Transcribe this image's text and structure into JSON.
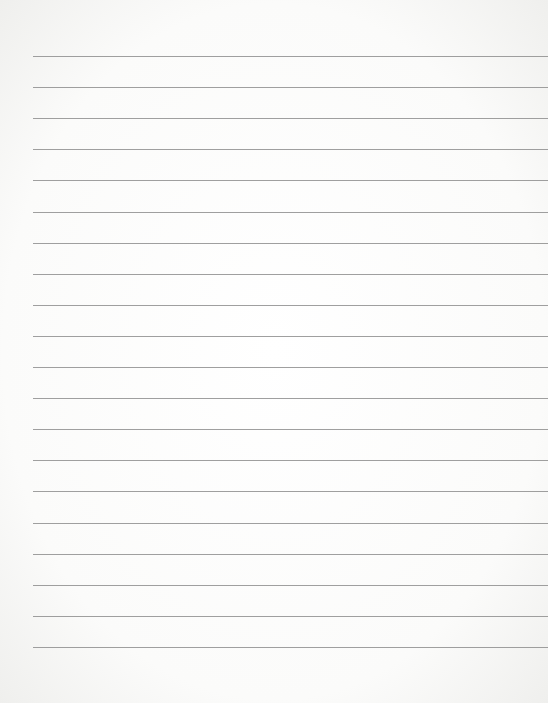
{
  "page": {
    "type": "blank lined paper",
    "line_count": 20,
    "first_line_y": 56,
    "line_spacing": 31.1,
    "line_left_margin": 33,
    "line_color": "#8e8e8e",
    "background_color": "#ffffff"
  }
}
